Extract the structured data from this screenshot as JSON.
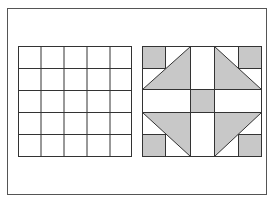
{
  "figure": {
    "frame": {
      "x": 7,
      "y": 8,
      "width": 260,
      "height": 187
    },
    "colors": {
      "line": "#333333",
      "fill": "#c8c8c8",
      "background": "#ffffff"
    },
    "left_panel": {
      "type": "grid",
      "rows": 5,
      "cols": 5,
      "x": 18,
      "y": 46,
      "width": 113,
      "height": 110
    },
    "right_panel": {
      "type": "quilt-block",
      "rows": 5,
      "cols": 5,
      "x": 142,
      "y": 46,
      "width": 119,
      "height": 110,
      "shaded_regions": [
        "corner-squares",
        "large-triangles",
        "center-square"
      ]
    }
  }
}
